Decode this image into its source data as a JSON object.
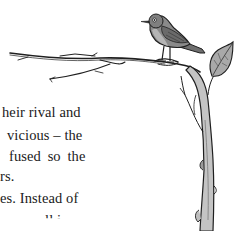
{
  "page": {
    "background": "#ffffff",
    "text_color": "#1a1a1a"
  },
  "body_text": {
    "lines": [
      {
        "text": "heir rival and",
        "x": 2,
        "y": 0
      },
      {
        "text": "vicious – the",
        "x": 7,
        "y": 23
      },
      {
        "text": "fused so the",
        "x": 9,
        "y": 44
      },
      {
        "text": "rs.",
        "x": 0,
        "y": 64
      },
      {
        "text": "es. Instead of",
        "x": 0,
        "y": 86
      },
      {
        "text": "ll i",
        "x": 45,
        "y": 108
      }
    ]
  },
  "illustration": {
    "subject": "bird perched on a bare branch with a single leaf",
    "icons": [
      "bird-icon",
      "branch-icon",
      "leaf-icon",
      "tree-trunk-icon"
    ],
    "colors": {
      "ink": "#1f1f1f",
      "bird_body": "#8a8a8a",
      "bird_breast": "#b5b5b5",
      "leaf": "#a9a9a9",
      "trunk": "#bdbdbd"
    }
  }
}
